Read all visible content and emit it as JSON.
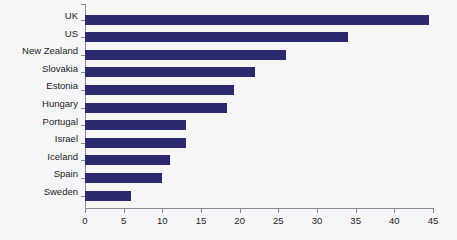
{
  "chart_data": {
    "type": "bar",
    "orientation": "horizontal",
    "title": "",
    "subtitle": "",
    "xlabel": "",
    "ylabel": "",
    "categories": [
      "UK",
      "US",
      "New Zealand",
      "Slovakia",
      "Estonia",
      "Hungary",
      "Portugal",
      "Israel",
      "Iceland",
      "Spain",
      "Sweden"
    ],
    "values": [
      44.5,
      34,
      26,
      22,
      19.3,
      18.3,
      13,
      13,
      11,
      10,
      6
    ],
    "series": [
      {
        "name": "",
        "values": [
          44.5,
          34,
          26,
          22,
          19.3,
          18.3,
          13,
          13,
          11,
          10,
          6
        ]
      }
    ],
    "xlim": [
      0,
      45
    ],
    "xticks": [
      0,
      5,
      10,
      15,
      20,
      25,
      30,
      35,
      40,
      45
    ],
    "xtick_labels": [
      "0",
      "5",
      "10",
      "15",
      "20",
      "25",
      "30",
      "35",
      "40",
      "45"
    ],
    "grid": false,
    "legend": "none",
    "bar_color": "#2b2a6e",
    "background_color": "#f6f6f8",
    "axis_color": "#8a8a92",
    "text_color": "#1c1c1c"
  }
}
